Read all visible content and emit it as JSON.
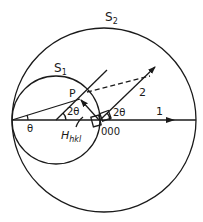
{
  "diagram": {
    "labels": {
      "sphere_large": "S",
      "sphere_large_sub": "2",
      "sphere_small": "S",
      "sphere_small_sub": "1",
      "point_p": "P",
      "angle_center": "2θ",
      "angle_origin": "2θ",
      "angle_left": "θ",
      "reciprocal_vector": "H",
      "reciprocal_vector_sub": "hkl",
      "origin": "000",
      "beam_incident": "1",
      "beam_diffracted": "2"
    },
    "colors": {
      "ink": "#1a1a1a",
      "background": "#ffffff"
    }
  }
}
